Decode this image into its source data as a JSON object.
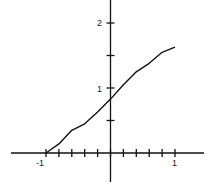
{
  "chart_data": {
    "type": "line",
    "title": "",
    "xlabel": "",
    "ylabel": "",
    "xlim": [
      -1.6,
      1.5
    ],
    "ylim": [
      -0.45,
      2.3
    ],
    "grid": false,
    "x_tick_labels": [
      "-1",
      "1"
    ],
    "y_tick_labels": [
      "1",
      "2"
    ],
    "x_minor_tick_step": 0.2,
    "y_minor_tick_step": 0.5,
    "series": [
      {
        "name": "curve",
        "x": [
          -1.0,
          -0.8,
          -0.6,
          -0.4,
          -0.2,
          0.0,
          0.2,
          0.4,
          0.6,
          0.8,
          1.0
        ],
        "y": [
          0.0,
          0.14,
          0.35,
          0.45,
          0.63,
          0.83,
          1.05,
          1.25,
          1.38,
          1.55,
          1.63
        ]
      }
    ]
  }
}
